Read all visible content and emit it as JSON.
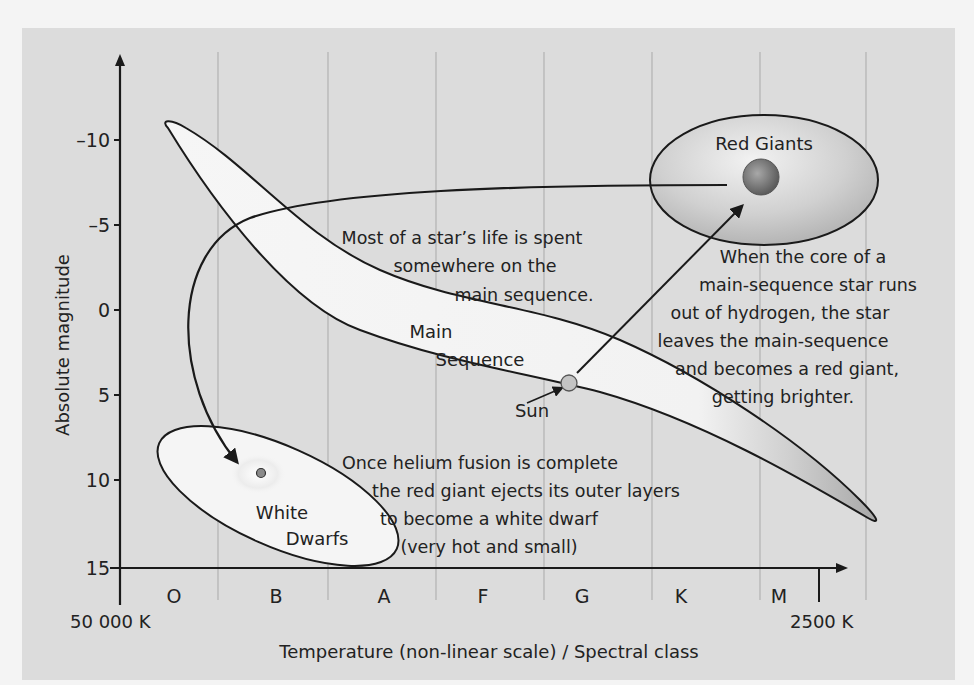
{
  "diagram": {
    "y_axis": {
      "label": "Absolute magnitude",
      "ticks": [
        "–10",
        "–5",
        "0",
        "5",
        "10",
        "15"
      ]
    },
    "x_axis": {
      "label": "Temperature (non-linear scale) / Spectral class",
      "spectral_classes": [
        "O",
        "B",
        "A",
        "F",
        "G",
        "K",
        "M"
      ],
      "left_temp": "50 000 K",
      "right_temp": "2500 K"
    },
    "regions": {
      "main_sequence": [
        "Main",
        "Sequence"
      ],
      "red_giants": "Red Giants",
      "white_dwarfs": [
        "White",
        "Dwarfs"
      ],
      "sun": "Sun"
    },
    "notes": {
      "main_sequence_note": [
        "Most of a star’s life is spent",
        "somewhere on the",
        "main sequence."
      ],
      "red_giant_note": [
        "When the core of a",
        "main-sequence star runs",
        "out of hydrogen, the star",
        "leaves the main-sequence",
        "and becomes a red giant,",
        "getting brighter."
      ],
      "white_dwarf_note": [
        "Once helium fusion is complete",
        "the red giant ejects its outer layers",
        "to become a white dwarf",
        "(very hot and small)"
      ]
    },
    "colors": {
      "panel_bg": "#dcdcdc",
      "region_fill": "#f5f5f5",
      "red_giant_fill": "#b8b8b8",
      "star_core": "#777777",
      "sun_fill": "#c8c8c8",
      "axis": "#1a1a1a",
      "grid": "#a9a9a9"
    }
  }
}
